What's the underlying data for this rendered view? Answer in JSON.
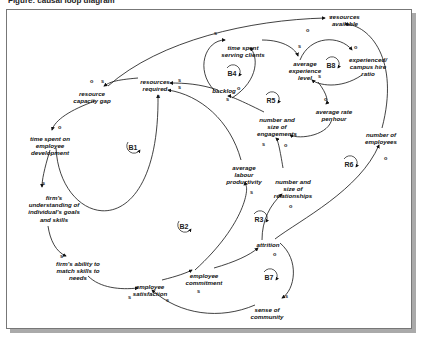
{
  "caption": "Figure: causal loop diagram",
  "variables": [
    {
      "id": "resources_available",
      "label": "resources\navailable",
      "x": 345,
      "y": 13
    },
    {
      "id": "time_spent_serving_clients",
      "label": "time spent\nserving clients",
      "x": 243,
      "y": 48
    },
    {
      "id": "average_experience_level",
      "label": "average\nexperience\nlevel",
      "x": 305,
      "y": 65
    },
    {
      "id": "experienced_campus_hire_ratio",
      "label": "experienced/\ncampus hire\nratio",
      "x": 366,
      "y": 60
    },
    {
      "id": "resources_required",
      "label": "resources\nrequired",
      "x": 155,
      "y": 79
    },
    {
      "id": "backlog",
      "label": "backlog",
      "x": 226,
      "y": 90
    },
    {
      "id": "resource_capacity_gap",
      "label": "resource\ncapacity gap",
      "x": 92,
      "y": 92
    },
    {
      "id": "average_rate_per_hour",
      "label": "average rate\nper hour",
      "x": 334,
      "y": 111
    },
    {
      "id": "number_size_engagements",
      "label": "number and\nsize of\nengagements",
      "x": 276,
      "y": 122
    },
    {
      "id": "time_spent_employee_dev",
      "label": "time spent on\nemployee\ndevelopment",
      "x": 48,
      "y": 139
    },
    {
      "id": "number_of_employees",
      "label": "number of\nemployees",
      "x": 381,
      "y": 135
    },
    {
      "id": "average_labour_productivity",
      "label": "average\nlabour\nproductivity",
      "x": 244,
      "y": 169
    },
    {
      "id": "number_size_relationships",
      "label": "number and\nsize of\nrelationships",
      "x": 292,
      "y": 179
    },
    {
      "id": "firms_understanding",
      "label": "firm's\nunderstanding of\nindividual's goals\nand skills",
      "x": 54,
      "y": 199
    },
    {
      "id": "attrition",
      "label": "attrition",
      "x": 268,
      "y": 243
    },
    {
      "id": "firms_ability",
      "label": "firm's ability to\nmatch skills to\nneeds",
      "x": 78,
      "y": 260
    },
    {
      "id": "employee_commitment",
      "label": "employee\ncommitment",
      "x": 202,
      "y": 272
    },
    {
      "id": "employee_satisfaction",
      "label": "employee\nsatisfaction",
      "x": 147,
      "y": 280
    },
    {
      "id": "sense_of_community",
      "label": "sense of\ncommunity",
      "x": 266,
      "y": 301
    }
  ],
  "loops": [
    {
      "label": "B1",
      "x": 133,
      "y": 147
    },
    {
      "label": "B2",
      "x": 184,
      "y": 226
    },
    {
      "label": "B4",
      "x": 232,
      "y": 73
    },
    {
      "label": "R5",
      "x": 271,
      "y": 100
    },
    {
      "label": "B8",
      "x": 331,
      "y": 65
    },
    {
      "label": "R6",
      "x": 349,
      "y": 164
    },
    {
      "label": "R3",
      "x": 259,
      "y": 219
    },
    {
      "label": "B7",
      "x": 269,
      "y": 277
    }
  ],
  "polarities": [
    {
      "t": "s",
      "x": 329,
      "y": 17
    },
    {
      "t": "o",
      "x": 306,
      "y": 30
    },
    {
      "t": "s",
      "x": 214,
      "y": 33
    },
    {
      "t": "s",
      "x": 298,
      "y": 46
    },
    {
      "t": "o",
      "x": 354,
      "y": 47
    },
    {
      "t": "s",
      "x": 318,
      "y": 76
    },
    {
      "t": "o",
      "x": 324,
      "y": 99
    },
    {
      "t": "s",
      "x": 178,
      "y": 80
    },
    {
      "t": "s",
      "x": 178,
      "y": 87
    },
    {
      "t": "s",
      "x": 157,
      "y": 96
    },
    {
      "t": "o",
      "x": 237,
      "y": 88
    },
    {
      "t": "s",
      "x": 226,
      "y": 99
    },
    {
      "t": "o",
      "x": 90,
      "y": 81
    },
    {
      "t": "s",
      "x": 101,
      "y": 81
    },
    {
      "t": "o",
      "x": 58,
      "y": 127
    },
    {
      "t": "s",
      "x": 262,
      "y": 144
    },
    {
      "t": "o",
      "x": 284,
      "y": 145
    },
    {
      "t": "o",
      "x": 384,
      "y": 158
    },
    {
      "t": "s",
      "x": 250,
      "y": 192
    },
    {
      "t": "o",
      "x": 289,
      "y": 206
    },
    {
      "t": "s",
      "x": 42,
      "y": 183
    },
    {
      "t": "o",
      "x": 273,
      "y": 254
    },
    {
      "t": "s",
      "x": 60,
      "y": 256
    },
    {
      "t": "s",
      "x": 128,
      "y": 297
    },
    {
      "t": "s",
      "x": 197,
      "y": 291
    },
    {
      "t": "s",
      "x": 285,
      "y": 296
    },
    {
      "t": "s",
      "x": 166,
      "y": 300
    }
  ]
}
